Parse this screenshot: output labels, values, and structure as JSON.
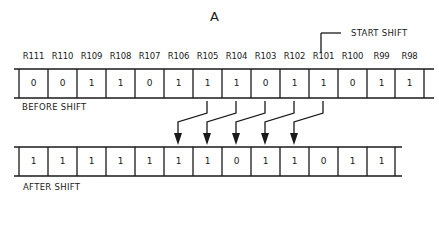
{
  "title": "A",
  "start_shift_label": "START SHIFT",
  "before": {
    "caption": "BEFORE SHIFT",
    "registers": [
      "R111",
      "R110",
      "R109",
      "R108",
      "R107",
      "R106",
      "R105",
      "R104",
      "R103",
      "R102",
      "R101",
      "R100",
      "R99",
      "R98"
    ],
    "values": [
      "0",
      "0",
      "1",
      "1",
      "0",
      "1",
      "1",
      "1",
      "0",
      "1",
      "1",
      "0",
      "1",
      "1"
    ]
  },
  "after": {
    "caption": "AFTER SHIFT",
    "values": [
      "1",
      "1",
      "1",
      "1",
      "1",
      "1",
      "1",
      "0",
      "1",
      "1",
      "0",
      "1",
      "1"
    ]
  },
  "shift_arrows": [
    {
      "from": "R105",
      "to_index": 5
    },
    {
      "from": "R104",
      "to_index": 6
    },
    {
      "from": "R103",
      "to_index": 7
    },
    {
      "from": "R102",
      "to_index": 8
    },
    {
      "from": "R101",
      "to_index": 9
    }
  ],
  "colors": {
    "line": "#1a1a1a",
    "background": "#ffffff"
  }
}
